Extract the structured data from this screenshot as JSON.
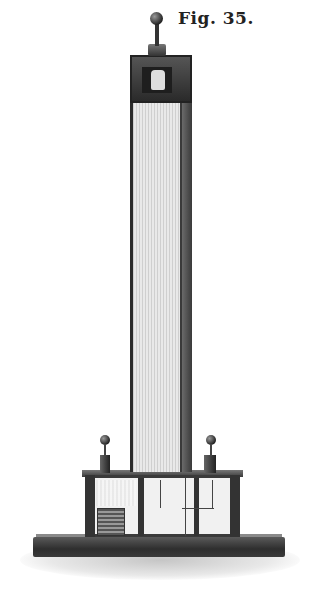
{
  "caption": "Fig. 35.",
  "illustration": {
    "subject": "tall column apparatus on cabinet base",
    "style": "engraving",
    "colors": {
      "ink": "#2a2a2a",
      "paper": "#ffffff",
      "mid": "#bdbdbd"
    }
  }
}
